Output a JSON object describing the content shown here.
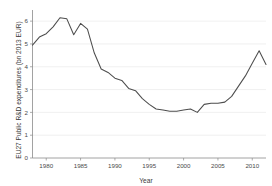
{
  "chart_data": {
    "type": "line",
    "title": "",
    "xlabel": "Year",
    "ylabel": "EU27 Public R&D expenditures (bn 2013 EUR)",
    "xlim": [
      1978,
      2012
    ],
    "ylim": [
      0,
      6.4
    ],
    "xticks": [
      1980,
      1985,
      1990,
      1995,
      2000,
      2005,
      2010
    ],
    "xtick_labels": [
      "1980",
      "1985",
      "1990",
      "1995",
      "2000",
      "2005",
      "2010"
    ],
    "yticks": [
      0,
      1,
      2,
      3,
      4,
      5,
      6
    ],
    "ytick_labels": [
      "0",
      "1",
      "2",
      "3",
      "4",
      "5",
      "6"
    ],
    "grid": "horizontal",
    "legend": "none",
    "line_color": "#4d4d4d",
    "x": [
      1978,
      1979,
      1980,
      1981,
      1982,
      1983,
      1984,
      1985,
      1986,
      1987,
      1988,
      1989,
      1990,
      1991,
      1992,
      1993,
      1994,
      1995,
      1996,
      1997,
      1998,
      1999,
      2000,
      2001,
      2002,
      2003,
      2004,
      2005,
      2006,
      2007,
      2008,
      2009,
      2010,
      2011,
      2012
    ],
    "values": [
      4.95,
      5.3,
      5.45,
      5.75,
      6.15,
      6.1,
      5.4,
      5.9,
      5.65,
      4.6,
      3.9,
      3.75,
      3.5,
      3.4,
      3.05,
      2.95,
      2.6,
      2.35,
      2.15,
      2.1,
      2.05,
      2.05,
      2.1,
      2.15,
      2.0,
      2.35,
      2.4,
      2.4,
      2.45,
      2.7,
      3.15,
      3.6,
      4.15,
      4.7,
      4.1
    ],
    "series_name": "EU27 Public R&D expenditures"
  },
  "axis": {
    "x_title": "Year",
    "y_title": "EU27 Public R&D expenditures (bn 2013 EUR)"
  }
}
